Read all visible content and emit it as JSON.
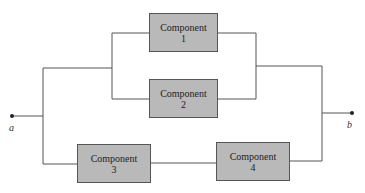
{
  "diagram": {
    "type": "reliability block diagram",
    "terminals": {
      "start": "a",
      "end": "b"
    },
    "components": [
      {
        "title": "Component",
        "number": "1"
      },
      {
        "title": "Component",
        "number": "2"
      },
      {
        "title": "Component",
        "number": "3"
      },
      {
        "title": "Component",
        "number": "4"
      }
    ],
    "structure": "Components 1 and 2 in parallel, in parallel with series path of Components 3 and 4"
  }
}
